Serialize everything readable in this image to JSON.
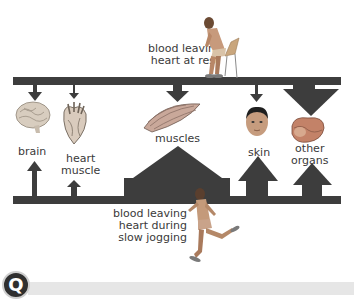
{
  "diagram": {
    "top_caption": [
      "blood leaving",
      "heart at rest"
    ],
    "bottom_caption": [
      "blood leaving",
      "heart during",
      "slow jogging"
    ],
    "organs": [
      {
        "id": "brain",
        "label": [
          "brain"
        ],
        "icon": "brain-icon"
      },
      {
        "id": "heart-muscle",
        "label": [
          "heart",
          "muscle"
        ],
        "icon": "heart-icon"
      },
      {
        "id": "muscles",
        "label": [
          "muscles"
        ],
        "icon": "muscle-icon"
      },
      {
        "id": "skin",
        "label": [
          "skin"
        ],
        "icon": "face-icon"
      },
      {
        "id": "other-organs",
        "label": [
          "other",
          "organs"
        ],
        "icon": "organs-icon"
      }
    ],
    "figures": {
      "top": "person-sitting-icon",
      "bottom": "person-jogging-icon"
    },
    "colors": {
      "bar": "#3d3d3d",
      "text": "#3a3a3a",
      "footer": "#e6e6e6"
    }
  },
  "footer": {
    "badge_glyph": "Q"
  }
}
